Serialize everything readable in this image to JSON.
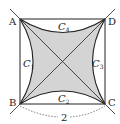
{
  "diagram": {
    "type": "geometry",
    "vertices": {
      "A": "A",
      "B": "B",
      "C": "C",
      "D": "D"
    },
    "curves": [
      {
        "name": "C",
        "sub": "1"
      },
      {
        "name": "C",
        "sub": "2"
      },
      {
        "name": "C",
        "sub": "3"
      },
      {
        "name": "C",
        "sub": "4"
      }
    ],
    "side_length_label": "2",
    "colors": {
      "shade": "#d4d4d4",
      "stroke": "#222222"
    }
  }
}
